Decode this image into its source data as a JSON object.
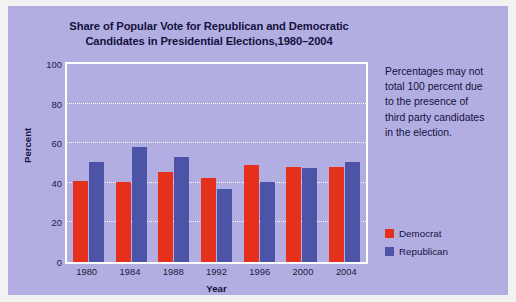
{
  "chart_data": {
    "type": "bar",
    "title": "Share of Popular Vote for Republican and Democratic Candidates in Presidential Elections,1980–2004",
    "title_line1": "Share of Popular Vote for Republican and Democratic",
    "title_line2": "Candidates in Presidential Elections,1980–2004",
    "xlabel": "Year",
    "ylabel": "Percent",
    "ylim": [
      0,
      100
    ],
    "yticks": [
      0,
      20,
      40,
      60,
      80,
      100
    ],
    "ytick_labels": [
      "0",
      "20",
      "40",
      "60",
      "80",
      "100"
    ],
    "categories": [
      "1980",
      "1984",
      "1988",
      "1992",
      "1996",
      "2000",
      "2004"
    ],
    "grid": true,
    "legend_position": "right",
    "series": [
      {
        "name": "Democrat",
        "color": "#e5301b",
        "values": [
          41,
          40.5,
          45.5,
          42.5,
          49,
          48,
          48
        ]
      },
      {
        "name": "Republican",
        "color": "#4d53a6",
        "values": [
          50.5,
          58,
          53,
          37,
          40.5,
          47.5,
          50.5
        ]
      }
    ],
    "annotation": "Percentages may not total 100 percent due to the presence of third party candidates in the election.",
    "annotation_lines": [
      "Percentages may not",
      "total 100 percent due",
      "to the presence of",
      "third party candidates",
      "in the election."
    ]
  },
  "colors": {
    "panel_background": "#b2aee2",
    "page_background": "#f2f2f2",
    "democrat": "#e5301b",
    "republican": "#4d53a6",
    "text": "#12123c",
    "gridline": "#ffffff",
    "plot_border": "#ffffff"
  }
}
